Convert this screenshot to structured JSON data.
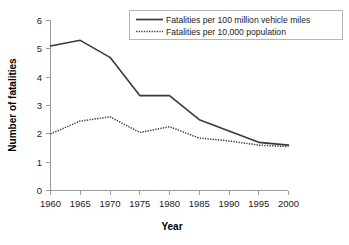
{
  "chart_data": {
    "type": "line",
    "title": "",
    "xlabel": "Year",
    "ylabel": "Number of fatalities",
    "x": [
      1960,
      1965,
      1970,
      1975,
      1980,
      1985,
      1990,
      1995,
      2000
    ],
    "xticklabels": [
      "1960",
      "1965",
      "1970",
      "1975",
      "1980",
      "1985",
      "1990",
      "1995",
      "2000"
    ],
    "yticklabels": [
      "0",
      "1",
      "2",
      "3",
      "4",
      "5",
      "6"
    ],
    "yticks": [
      0,
      1,
      2,
      3,
      4,
      5,
      6
    ],
    "xlim": [
      1960,
      2000
    ],
    "ylim": [
      0,
      6
    ],
    "grid": false,
    "legend_position": "top-right",
    "series": [
      {
        "name": "Fatalities per 100 million vehicle miles",
        "style": "solid",
        "color": "#3a3a3a",
        "values": [
          5.1,
          5.3,
          4.7,
          3.35,
          3.35,
          2.5,
          2.1,
          1.7,
          1.6
        ]
      },
      {
        "name": "Fatalities per 10,000 population",
        "style": "dotted",
        "color": "#3a3a3a",
        "values": [
          2.0,
          2.45,
          2.6,
          2.05,
          2.25,
          1.85,
          1.75,
          1.6,
          1.55
        ]
      }
    ]
  },
  "legend": {
    "entries": [
      {
        "label": "Fatalities per 100 million vehicle miles"
      },
      {
        "label": "Fatalities per 10,000 population"
      }
    ]
  },
  "axes": {
    "x_title": "Year",
    "y_title": "Number of fatalities"
  }
}
